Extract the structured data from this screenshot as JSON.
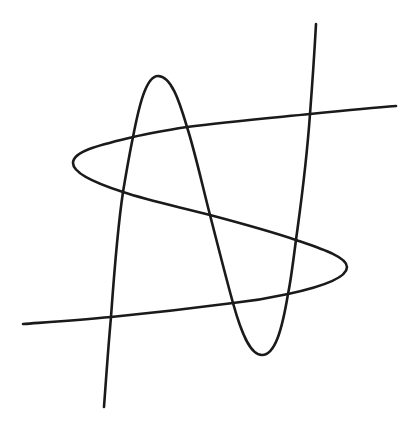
{
  "figure": {
    "background": "#ffffff",
    "stroke_color": "#1a1a1a",
    "curves": [
      {
        "name": "vertical-cubic-curve",
        "path": "M 316 24 C 314 60, 312 88, 310 114 C 306 170, 300 210, 296 240 C 293 262, 291 280, 288 294 C 282 330, 275 355, 262 355 C 250 355, 241 332, 233 303 C 226 278, 218 246, 210 215 C 202 184, 195 152, 187 127 C 179 100, 171 76, 158 76 C 146 76, 139 106, 133 137 C 129 156, 126 174, 123 192 C 117 232, 114 275, 111 317 C 108 350, 106 380, 104 407"
      },
      {
        "name": "horizontal-cubic-curve",
        "path": "M 396 106 C 370 108, 340 111, 310 114 C 270 118, 225 122, 187 127 C 168 130, 150 133, 133 137 C 100 145, 73 151, 73 163 C 73 174, 98 184, 123 192 C 150 201, 180 207, 210 215 C 240 223, 270 231, 296 240 C 322 249, 347 257, 347 267 C 347 279, 316 288, 288 294 C 270 298, 252 301, 233 303 C 195 308, 152 313, 111 317 C 80 320, 50 322, 23 324"
      }
    ],
    "intersections": [
      [
        310,
        114
      ],
      [
        187,
        127
      ],
      [
        133,
        137
      ],
      [
        123,
        192
      ],
      [
        210,
        215
      ],
      [
        296,
        240
      ],
      [
        288,
        294
      ],
      [
        233,
        303
      ],
      [
        111,
        317
      ]
    ]
  }
}
